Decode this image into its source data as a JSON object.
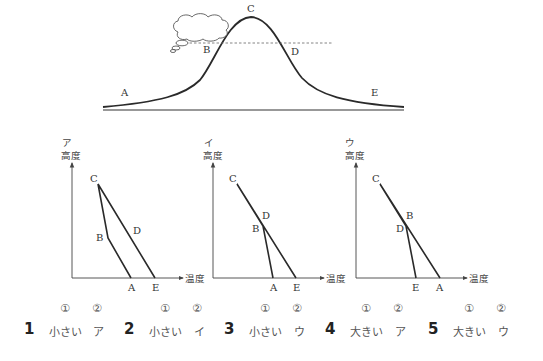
{
  "mountain": {
    "points": [
      "A",
      "B",
      "C",
      "D",
      "E"
    ],
    "labels": {
      "A": "A",
      "B": "B",
      "C": "C",
      "D": "D",
      "E": "E"
    },
    "dashed_line": "cloud base level (B–D)",
    "cloud": "cloud on windward slope"
  },
  "graphs": [
    {
      "id": "ア",
      "title": "ア",
      "ylabel": "高度",
      "xlabel": "温度",
      "labels": {
        "A": "A",
        "B": "B",
        "C": "C",
        "D": "D",
        "E": "E"
      }
    },
    {
      "id": "イ",
      "title": "イ",
      "ylabel": "高度",
      "xlabel": "温度",
      "labels": {
        "A": "A",
        "B": "B",
        "C": "C",
        "D": "D",
        "E": "E"
      }
    },
    {
      "id": "ウ",
      "title": "ウ",
      "ylabel": "高度",
      "xlabel": "温度",
      "labels": {
        "A": "A",
        "B": "B",
        "C": "C",
        "D": "D",
        "E": "E"
      }
    }
  ],
  "choices_header": {
    "col1": "①",
    "col2": "②"
  },
  "choices": [
    {
      "num": "1",
      "ans1": "小さい",
      "ans2": "ア"
    },
    {
      "num": "2",
      "ans1": "小さい",
      "ans2": "イ"
    },
    {
      "num": "3",
      "ans1": "小さい",
      "ans2": "ウ"
    },
    {
      "num": "4",
      "ans1": "大きい",
      "ans2": "ア"
    },
    {
      "num": "5",
      "ans1": "大きい",
      "ans2": "ウ"
    }
  ]
}
